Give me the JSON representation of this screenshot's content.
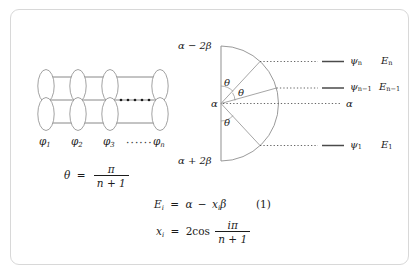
{
  "figure": {
    "border_color": "#d8d8d8",
    "ink_color": "#1b1b1b",
    "line_color": "#6e6e6e"
  },
  "orbital_chain": {
    "name": "p-orbital chain",
    "orbital_count_drawn": 4,
    "labels": [
      "φ₁",
      "φ₂",
      "φ₃",
      "φₙ"
    ],
    "label_parts": [
      {
        "base": "φ",
        "sub": "1"
      },
      {
        "base": "φ",
        "sub": "2"
      },
      {
        "base": "φ",
        "sub": "3"
      },
      {
        "base": "φ",
        "sub": "n"
      }
    ],
    "ellipsis": "······",
    "continuation_dots": "• • • • • •",
    "connector_line_count": 3
  },
  "energy_diagram": {
    "name": "circle-mnemonic energy level diagram",
    "top_edge_label": "α − 2β",
    "bottom_edge_label": "α + 2β",
    "center_label": "α",
    "angle_label": "θ",
    "angle_label_count": 3,
    "levels": [
      {
        "psi": "ψₙ",
        "psi_base": "ψ",
        "psi_sub": "n",
        "energy": "Eₙ",
        "e_base": "E",
        "e_sub": "n",
        "has_level_line": true
      },
      {
        "psi": "ψₙ₋₁",
        "psi_base": "ψ",
        "psi_sub": "n−1",
        "energy": "Eₙ₋₁",
        "e_base": "E",
        "e_sub": "n−1",
        "has_level_line": true
      },
      {
        "psi": "",
        "psi_base": "",
        "psi_sub": "",
        "energy": "α",
        "e_base": "α",
        "e_sub": "",
        "has_level_line": false
      },
      {
        "psi": "ψ₁",
        "psi_base": "ψ",
        "psi_sub": "1",
        "energy": "E₁",
        "e_base": "E",
        "e_sub": "1",
        "has_level_line": true
      }
    ]
  },
  "equations": {
    "theta": {
      "lhs": "θ",
      "eq": "=",
      "num": "π",
      "den": "n + 1"
    },
    "energy": {
      "lhs_base": "E",
      "lhs_sub": "i",
      "eq": "=",
      "rhs": "α − xᵢβ",
      "rhs_alpha": "α",
      "rhs_minus": "−",
      "rhs_x": "x",
      "rhs_x_sub": "i",
      "rhs_beta": "β"
    },
    "x": {
      "lhs_base": "x",
      "lhs_sub": "i",
      "eq": "=",
      "coef": "2cos",
      "num_i": "i",
      "num_pi": "π",
      "den": "n + 1"
    },
    "number": "(1)"
  }
}
